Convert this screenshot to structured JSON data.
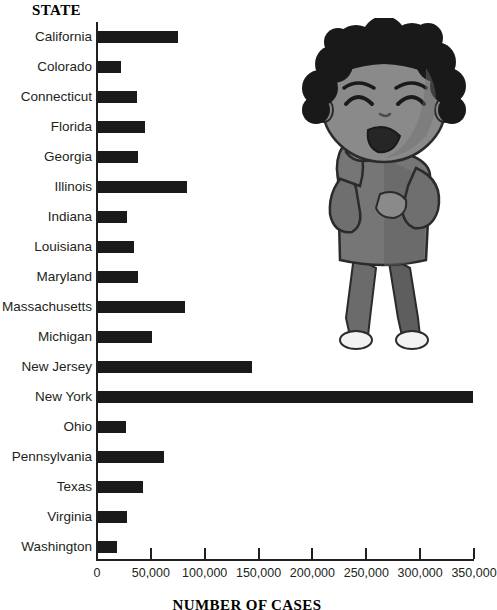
{
  "chart_data": {
    "type": "bar",
    "orientation": "horizontal",
    "title": "",
    "ylabel": "STATE",
    "xlabel": "NUMBER OF CASES",
    "xlim": [
      0,
      350000
    ],
    "xticks": [
      0,
      50000,
      100000,
      150000,
      200000,
      250000,
      300000,
      350000
    ],
    "xtick_labels": [
      "0",
      "50,000",
      "100,000",
      "150,000",
      "200,000",
      "250,000",
      "300,000",
      "350,000"
    ],
    "grid": false,
    "legend": false,
    "bar_color": "#1a1a1a",
    "categories": [
      "California",
      "Colorado",
      "Connecticut",
      "Florida",
      "Georgia",
      "Illinois",
      "Indiana",
      "Louisiana",
      "Maryland",
      "Massachusetts",
      "Michigan",
      "New Jersey",
      "New York",
      "Ohio",
      "Pennsylvania",
      "Texas",
      "Virginia",
      "Washington"
    ],
    "values": [
      75000,
      22000,
      37000,
      45000,
      38000,
      84000,
      28000,
      34000,
      38000,
      82000,
      51000,
      144000,
      349000,
      27000,
      62000,
      43000,
      28000,
      19000
    ]
  },
  "illustration": {
    "name": "child-coughing-illustration",
    "description": "Grayscale cartoon of a child with curly hair coughing into a hand"
  }
}
